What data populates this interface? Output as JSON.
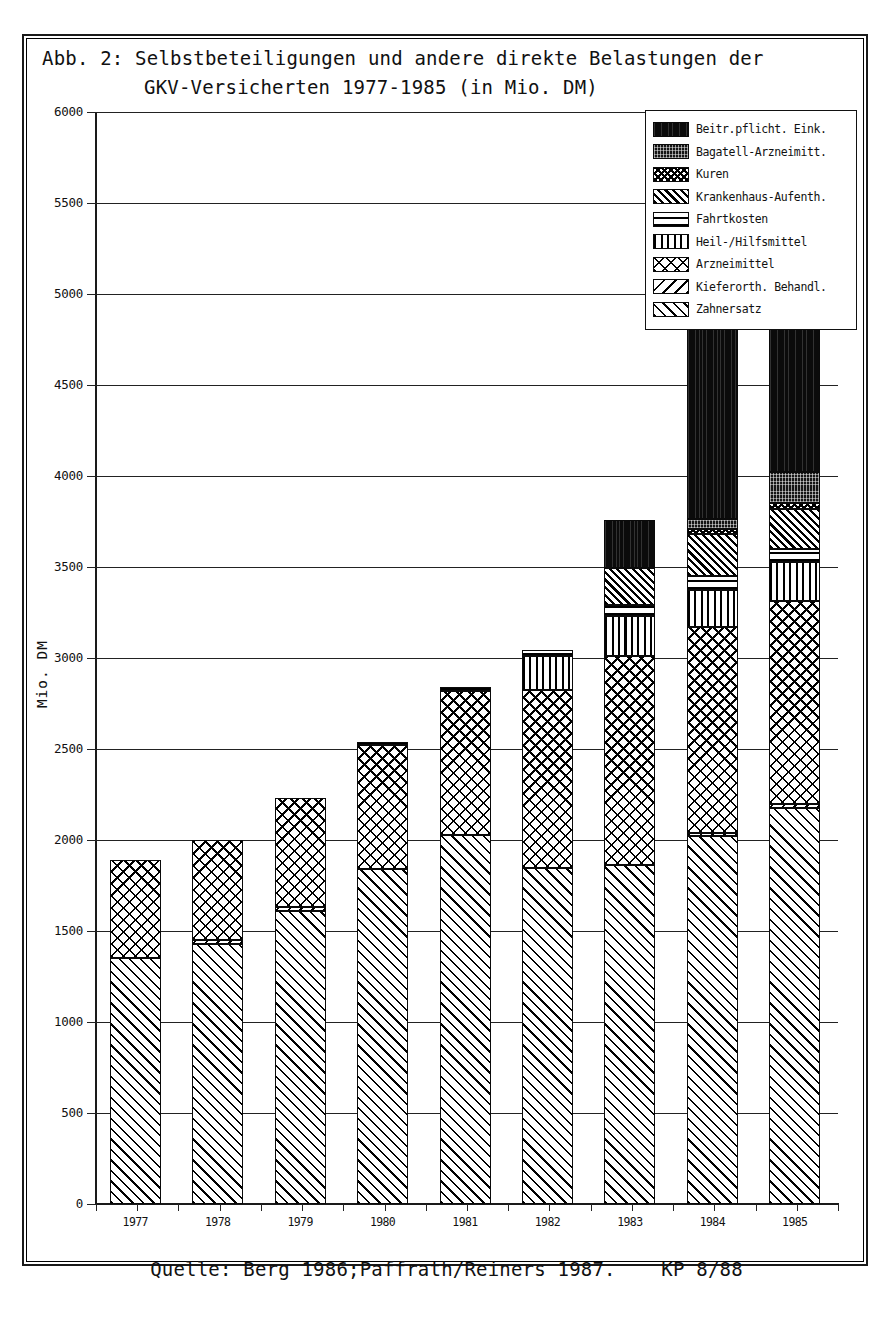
{
  "figure": {
    "title_line1": "Abb. 2: Selbstbeteiligungen und andere direkte Belastungen der",
    "title_line2": "GKV-Versicherten 1977-1985 (in Mio. DM)",
    "source": "Quelle: Berg 1986;Paffrath/Reiners 1987.",
    "code": "KP 8/88",
    "axis_label_y": "Mio. DM"
  },
  "legend": {
    "entries": [
      {
        "label": "Beitr.pflicht. Eink.",
        "pattern": "p-beitr"
      },
      {
        "label": "Bagatell-Arzneimitt.",
        "pattern": "p-bagatell"
      },
      {
        "label": "Kuren",
        "pattern": "p-kuren"
      },
      {
        "label": "Krankenhaus-Aufenth.",
        "pattern": "p-krankenhaus"
      },
      {
        "label": "Fahrtkosten",
        "pattern": "p-fahrt"
      },
      {
        "label": "Heil-/Hilfsmittel",
        "pattern": "p-heil"
      },
      {
        "label": "Arzneimittel",
        "pattern": "p-arznei"
      },
      {
        "label": "Kieferorth. Behandl.",
        "pattern": "p-kiefer"
      },
      {
        "label": "Zahnersatz",
        "pattern": "p-zahnersatz"
      }
    ]
  },
  "chart_data": {
    "type": "bar",
    "stacked": true,
    "title": "Abb. 2: Selbstbeteiligungen und andere direkte Belastungen der GKV-Versicherten 1977-1985 (in Mio. DM)",
    "xlabel": "",
    "ylabel": "Mio. DM",
    "ylim": [
      0,
      6000
    ],
    "ytick_labels": [
      "0",
      "500",
      "1000",
      "1500",
      "2000",
      "2500",
      "3000",
      "3500",
      "4000",
      "4500",
      "5000",
      "5500",
      "6000"
    ],
    "ytick_values": [
      0,
      500,
      1000,
      1500,
      2000,
      2500,
      3000,
      3500,
      4000,
      4500,
      5000,
      5500,
      6000
    ],
    "grid": true,
    "legend_position": "top-right",
    "categories": [
      "1977",
      "1978",
      "1979",
      "1980",
      "1981",
      "1982",
      "1983",
      "1984",
      "1985"
    ],
    "series": [
      {
        "name": "Zahnersatz",
        "pattern": "p-zahnersatz",
        "values": [
          1350,
          1430,
          1610,
          1840,
          2030,
          1845,
          1860,
          2020,
          2175
        ]
      },
      {
        "name": "Kieferorth. Behandl.",
        "pattern": "p-kiefer",
        "values": [
          0,
          20,
          20,
          0,
          0,
          0,
          0,
          20,
          25
        ]
      },
      {
        "name": "Arzneimittel",
        "pattern": "p-arznei",
        "values": [
          540,
          550,
          600,
          680,
          790,
          980,
          1150,
          1130,
          1115
        ]
      },
      {
        "name": "Heil-/Hilfsmittel",
        "pattern": "p-heil",
        "values": [
          0,
          0,
          0,
          0,
          0,
          185,
          220,
          205,
          215
        ]
      },
      {
        "name": "Fahrtkosten",
        "pattern": "p-fahrt",
        "values": [
          0,
          0,
          0,
          20,
          20,
          35,
          60,
          75,
          70
        ]
      },
      {
        "name": "Krankenhaus-Aufenth.",
        "pattern": "p-krankenhaus",
        "values": [
          0,
          0,
          0,
          0,
          0,
          0,
          205,
          230,
          220
        ]
      },
      {
        "name": "Kuren",
        "pattern": "p-kuren",
        "values": [
          0,
          0,
          0,
          0,
          0,
          0,
          0,
          30,
          30
        ]
      },
      {
        "name": "Bagatell-Arzneimitt.",
        "pattern": "p-bagatell",
        "values": [
          0,
          0,
          0,
          0,
          0,
          0,
          0,
          55,
          170
        ]
      },
      {
        "name": "Beitr.pflicht. Eink.",
        "pattern": "p-beitr",
        "values": [
          0,
          0,
          0,
          0,
          0,
          0,
          265,
          1705,
          1620
        ]
      }
    ],
    "totals": [
      1890,
      2000,
      2230,
      2540,
      2840,
      3045,
      3760,
      5470,
      5640
    ]
  }
}
